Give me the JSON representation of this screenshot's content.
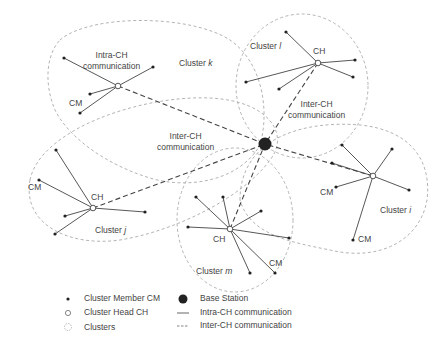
{
  "diagram": {
    "colors": {
      "line": "#444444",
      "cluster_outline": "#aaaaaa",
      "node_fill": "#222222",
      "base_station": "#222222"
    },
    "base_station": {
      "x": 265,
      "y": 144
    },
    "clusters": [
      {
        "id": "k",
        "label": "Cluster",
        "letter": "k",
        "ch": {
          "x": 118,
          "y": 86
        },
        "members": [
          [
            64,
            58
          ],
          [
            153,
            67
          ],
          [
            90,
            94
          ],
          [
            80,
            113
          ]
        ]
      },
      {
        "id": "l",
        "label": "Cluster",
        "letter": "l",
        "ch": {
          "x": 318,
          "y": 63
        },
        "members": [
          [
            286,
            32
          ],
          [
            355,
            60
          ],
          [
            353,
            77
          ],
          [
            246,
            82
          ],
          [
            279,
            89
          ]
        ]
      },
      {
        "id": "j",
        "label": "Cluster",
        "letter": "j",
        "ch": {
          "x": 93,
          "y": 208
        },
        "members": [
          [
            56,
            150
          ],
          [
            39,
            180
          ],
          [
            65,
            216
          ],
          [
            55,
            234
          ],
          [
            145,
            212
          ]
        ]
      },
      {
        "id": "i",
        "label": "Cluster",
        "letter": "i",
        "ch": {
          "x": 373,
          "y": 176
        },
        "members": [
          [
            342,
            145
          ],
          [
            392,
            149
          ],
          [
            332,
            163
          ],
          [
            336,
            187
          ],
          [
            409,
            190
          ],
          [
            353,
            240
          ]
        ]
      },
      {
        "id": "m",
        "label": "Cluster",
        "letter": "m",
        "ch": {
          "x": 230,
          "y": 229
        },
        "members": [
          [
            196,
            197
          ],
          [
            223,
            197
          ],
          [
            261,
            211
          ],
          [
            188,
            227
          ],
          [
            289,
            238
          ],
          [
            250,
            273
          ],
          [
            275,
            273
          ]
        ]
      }
    ],
    "labels": {
      "intra_ch_line1": "Intra-CH",
      "intra_ch_line2": "communication",
      "inter_ch_center_line1": "Inter-CH",
      "inter_ch_center_line2": "communication",
      "inter_ch_right_line1": "Inter-CH",
      "inter_ch_right_line2": "communication",
      "cm": "CM",
      "ch": "CH",
      "cluster_k": "Cluster",
      "cluster_l": "Cluster",
      "cluster_j": "Cluster",
      "cluster_i": "Cluster",
      "cluster_m": "Cluster",
      "k": "k",
      "l": "l",
      "j": "j",
      "i": "i",
      "m": "m"
    }
  },
  "legend": {
    "cluster_member": "Cluster Member CM",
    "cluster_head": "Cluster Head CH",
    "clusters": "Clusters",
    "base_station": "Base Station",
    "intra_ch": "Intra-CH communication",
    "inter_ch": "Inter-CH communication"
  }
}
